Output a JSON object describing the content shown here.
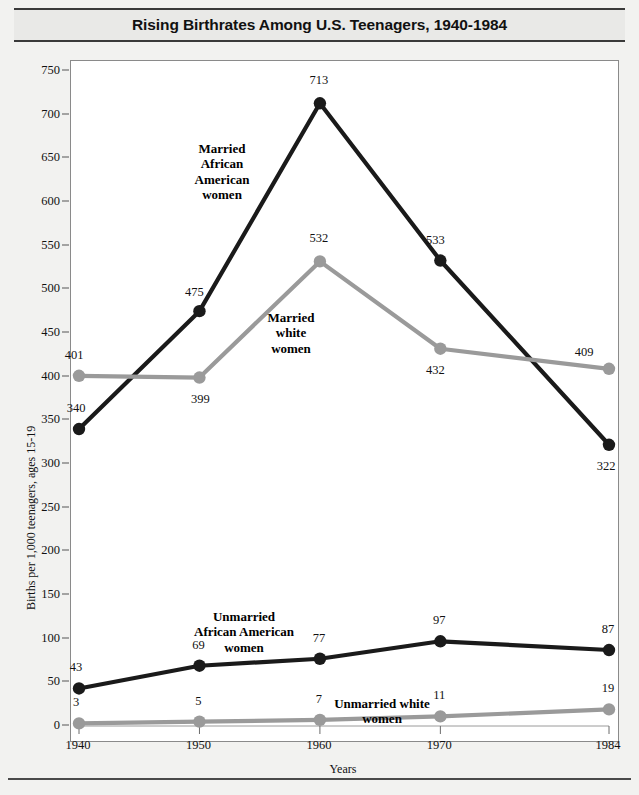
{
  "title": "Rising Birthrates Among U.S. Teenagers, 1940-1984",
  "axes": {
    "ylabel": "Births per 1,000 teenagers, ages 15-19",
    "xlabel": "Years",
    "yticks": [
      "0",
      "50",
      "100",
      "150",
      "200",
      "250",
      "300",
      "350",
      "400",
      "450",
      "500",
      "550",
      "600",
      "650",
      "700",
      "750"
    ],
    "xticks": [
      "1940",
      "1950",
      "1960",
      "1970",
      "1984"
    ]
  },
  "annotations": {
    "married_black": "Married\nAfrican\nAmerican\nwomen",
    "married_white": "Married\nwhite\nwomen",
    "unmarried_black": "Unmarried\nAfrican American\nwomen",
    "unmarried_white": "Unmarried white\nwomen"
  },
  "colors": {
    "dark_series": "#1a1a1a",
    "light_series": "#9a9a9a",
    "frame": "#8a8a8a",
    "page_background": "#f2f2f0",
    "plot_background": "#ffffff"
  },
  "source": "",
  "chart_data": {
    "type": "line",
    "title": "Rising Birthrates Among U.S. Teenagers, 1940-1984",
    "xlabel": "Years",
    "ylabel": "Births per 1,000 teenagers, ages 15-19",
    "categories": [
      "1940",
      "1950",
      "1960",
      "1970",
      "1984"
    ],
    "x": [
      1940,
      1950,
      1960,
      1970,
      1984
    ],
    "ylim": [
      0,
      750
    ],
    "ytick_step": 50,
    "grid": false,
    "legend": "inline-annotations",
    "series": [
      {
        "name": "Married African American women",
        "color": "#1a1a1a",
        "values": [
          340,
          475,
          713,
          533,
          322
        ],
        "labels": [
          "340",
          "475",
          "713",
          "533",
          "322"
        ]
      },
      {
        "name": "Married white women",
        "color": "#9a9a9a",
        "values": [
          401,
          399,
          532,
          432,
          409
        ],
        "labels": [
          "401",
          "399",
          "532",
          "432",
          "409"
        ]
      },
      {
        "name": "Unmarried African American women",
        "color": "#1a1a1a",
        "values": [
          43,
          69,
          77,
          97,
          87
        ],
        "labels": [
          "43",
          "69",
          "77",
          "97",
          "87"
        ]
      },
      {
        "name": "Unmarried white women",
        "color": "#9a9a9a",
        "values": [
          3,
          5,
          7,
          11,
          19
        ],
        "labels": [
          "3",
          "5",
          "7",
          "11",
          "19"
        ]
      }
    ]
  }
}
